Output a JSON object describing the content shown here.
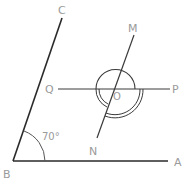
{
  "diagram": {
    "type": "geometry",
    "stroke_color": "#2a2a2a",
    "label_color": "#9a9a9a",
    "points": {
      "A": {
        "label": "A",
        "x": 168,
        "y": 161
      },
      "B": {
        "label": "B",
        "x": 13,
        "y": 161
      },
      "C": {
        "label": "C",
        "x": 62,
        "y": 18
      },
      "M": {
        "label": "M",
        "x": 134,
        "y": 35
      },
      "N": {
        "label": "N",
        "x": 97,
        "y": 138
      },
      "O": {
        "label": "O",
        "x": 114,
        "y": 89
      },
      "P": {
        "label": "P",
        "x": 170,
        "y": 89
      },
      "Q": {
        "label": "Q",
        "x": 58,
        "y": 89
      }
    },
    "angle_label": "70°",
    "segments": [
      {
        "from": "B",
        "to": "A"
      },
      {
        "from": "B",
        "to": "C"
      },
      {
        "from": "Q",
        "to": "P"
      },
      {
        "from": "M",
        "to": "N"
      }
    ]
  }
}
